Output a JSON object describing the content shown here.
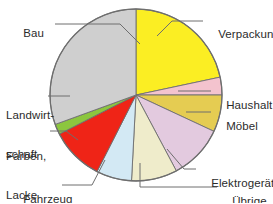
{
  "chart_data": {
    "type": "pie",
    "title": "",
    "subtitle": "",
    "xlabel": "",
    "ylabel": "",
    "legend_position": "callout-labels",
    "grid": false,
    "center": {
      "x": 136,
      "y": 95
    },
    "radius": 86,
    "start_angle_deg": 0,
    "direction": "clockwise",
    "labels": [
      "Verpackung",
      "Haushalt",
      "Möbel",
      "Elektrogeräte",
      "Übrige",
      "Fahrzeug",
      "Farben, Lacke",
      "Landwirtschaft",
      "Bau"
    ],
    "values": [
      21.7,
      3.3,
      6.9,
      10.3,
      8.6,
      6.7,
      10.0,
      1.9,
      30.6
    ],
    "colors": [
      "#fbee23",
      "#f3c3ce",
      "#e5cc52",
      "#e3cadf",
      "#efeccb",
      "#d3e9f4",
      "#ef2417",
      "#8cc63e",
      "#cfcfcf"
    ],
    "slices": [
      {
        "label": "Verpackung",
        "value": 21.7,
        "start_deg": 0.0,
        "end_deg": 78.0,
        "color": "#fbee23"
      },
      {
        "label": "Haushalt",
        "value": 3.3,
        "start_deg": 78.0,
        "end_deg": 90.0,
        "color": "#f3c3ce"
      },
      {
        "label": "Möbel",
        "value": 6.9,
        "start_deg": 90.0,
        "end_deg": 115.0,
        "color": "#e5cc52"
      },
      {
        "label": "Elektrogeräte",
        "value": 10.3,
        "start_deg": 115.0,
        "end_deg": 152.0,
        "color": "#e3cadf"
      },
      {
        "label": "Übrige",
        "value": 8.6,
        "start_deg": 152.0,
        "end_deg": 183.0,
        "color": "#efeccb"
      },
      {
        "label": "Fahrzeug",
        "value": 6.7,
        "start_deg": 183.0,
        "end_deg": 207.0,
        "color": "#d3e9f4"
      },
      {
        "label": "Farben, Lacke",
        "value": 10.0,
        "start_deg": 207.0,
        "end_deg": 243.0,
        "color": "#ef2417"
      },
      {
        "label": "Landwirtschaft",
        "value": 1.9,
        "start_deg": 243.0,
        "end_deg": 250.0,
        "color": "#8cc63e"
      },
      {
        "label": "Bau",
        "value": 30.6,
        "start_deg": 250.0,
        "end_deg": 360.0,
        "color": "#cfcfcf"
      }
    ]
  },
  "callouts": {
    "verpackung": "Verpackung",
    "haushalt": "Haushalt",
    "moebel": "Möbel",
    "elektrogeraete": "Elektrogeräte",
    "uebrige": "Übrige",
    "fahrzeug": "Fahrzeug",
    "farben_line1": "Farben,",
    "farben_line2": "Lacke",
    "landwirtschaft_line1": "Landwirt-",
    "landwirtschaft_line2": "schaft",
    "bau": "Bau"
  },
  "style": {
    "background": "#ffffff",
    "outline": "#6e6e6e",
    "leader_line": "#6e6e6e",
    "text": "#2b2b2b"
  }
}
